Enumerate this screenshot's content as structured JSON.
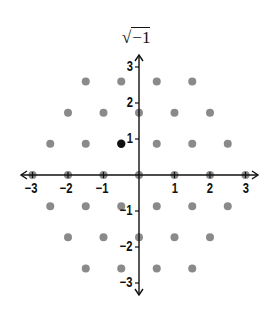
{
  "title": "√−1",
  "axes": {
    "x_ticks": [
      {
        "value": -3,
        "label": "−3"
      },
      {
        "value": -2,
        "label": "−2"
      },
      {
        "value": -1,
        "label": "−1"
      },
      {
        "value": 1,
        "label": "1"
      },
      {
        "value": 2,
        "label": "2"
      },
      {
        "value": 3,
        "label": "3"
      }
    ],
    "y_ticks": [
      {
        "value": 3,
        "label": "3"
      },
      {
        "value": 2,
        "label": "2"
      },
      {
        "value": 1,
        "label": "1"
      },
      {
        "value": -1,
        "label": "−1"
      },
      {
        "value": -2,
        "label": "−2"
      },
      {
        "value": -3,
        "label": "−3"
      }
    ]
  },
  "colors": {
    "axis": "#111111",
    "lattice_point": "#8a8a8a",
    "highlight_point": "#111111"
  },
  "highlight_point": {
    "x": -0.5,
    "y": 0.866
  },
  "lattice_points": [
    {
      "x": -1.5,
      "y": 2.598
    },
    {
      "x": -0.5,
      "y": 2.598
    },
    {
      "x": 0.5,
      "y": 2.598
    },
    {
      "x": 1.5,
      "y": 2.598
    },
    {
      "x": -2,
      "y": 1.732
    },
    {
      "x": -1,
      "y": 1.732
    },
    {
      "x": 0,
      "y": 1.732
    },
    {
      "x": 1,
      "y": 1.732
    },
    {
      "x": 2,
      "y": 1.732
    },
    {
      "x": -2.5,
      "y": 0.866
    },
    {
      "x": -1.5,
      "y": 0.866
    },
    {
      "x": 0.5,
      "y": 0.866
    },
    {
      "x": 1.5,
      "y": 0.866
    },
    {
      "x": 2.5,
      "y": 0.866
    },
    {
      "x": -3,
      "y": 0
    },
    {
      "x": -2,
      "y": 0
    },
    {
      "x": -1,
      "y": 0
    },
    {
      "x": 0,
      "y": 0
    },
    {
      "x": 1,
      "y": 0
    },
    {
      "x": 2,
      "y": 0
    },
    {
      "x": 3,
      "y": 0
    },
    {
      "x": -2.5,
      "y": -0.866
    },
    {
      "x": -1.5,
      "y": -0.866
    },
    {
      "x": -0.5,
      "y": -0.866
    },
    {
      "x": 0.5,
      "y": -0.866
    },
    {
      "x": 1.5,
      "y": -0.866
    },
    {
      "x": 2.5,
      "y": -0.866
    },
    {
      "x": -2,
      "y": -1.732
    },
    {
      "x": -1,
      "y": -1.732
    },
    {
      "x": 0,
      "y": -1.732
    },
    {
      "x": 1,
      "y": -1.732
    },
    {
      "x": 2,
      "y": -1.732
    },
    {
      "x": -1.5,
      "y": -2.598
    },
    {
      "x": -0.5,
      "y": -2.598
    },
    {
      "x": 0.5,
      "y": -2.598
    },
    {
      "x": 1.5,
      "y": -2.598
    }
  ]
}
